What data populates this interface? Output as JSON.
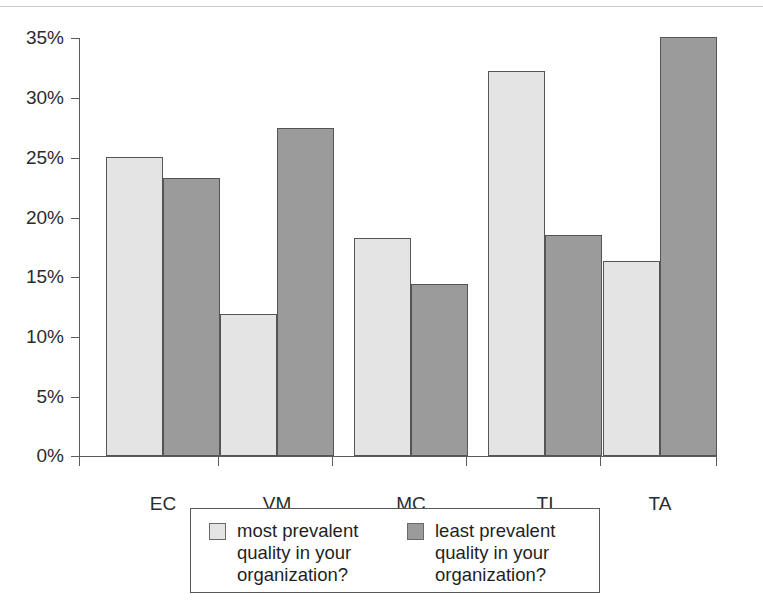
{
  "chart_data": {
    "type": "bar",
    "title": "",
    "subtitle": "",
    "xlabel": "",
    "ylabel": "",
    "categories": [
      "EC",
      "VM",
      "MC",
      "TI",
      "TA"
    ],
    "series": [
      {
        "name": "most prevalent quality in your organization?",
        "color": "#e4e4e4",
        "values": [
          25.0,
          11.9,
          18.2,
          32.2,
          16.3
        ]
      },
      {
        "name": "least prevalent quality in your organization?",
        "color": "#9b9b9b",
        "values": [
          23.2,
          27.4,
          14.4,
          18.5,
          35.0
        ]
      }
    ],
    "ylim": [
      0,
      35
    ],
    "ytick_values": [
      0,
      5,
      10,
      15,
      20,
      25,
      30,
      35
    ],
    "ytick_labels": [
      "0%",
      "5%",
      "10%",
      "15%",
      "20%",
      "25%",
      "30%",
      "35%"
    ],
    "grid": false,
    "legend_position": "bottom",
    "annotations": []
  },
  "axes": {
    "y_labels": [
      "35%",
      "30%",
      "25%",
      "20%",
      "15%",
      "10%",
      "5%",
      "0%"
    ],
    "x_labels": [
      "EC",
      "VM",
      "MC",
      "TI",
      "TA"
    ]
  },
  "legend": {
    "entries": [
      {
        "label": "most prevalent\nquality in your\norganization?",
        "swatch": "light-gray-swatch"
      },
      {
        "label": "least prevalent\nquality in your\norganization?",
        "swatch": "dark-gray-swatch"
      }
    ]
  },
  "colors": {
    "series_light": "#e4e4e4",
    "series_dark": "#9b9b9b",
    "axis": "#5b5b5b",
    "bar_outline": "#555555",
    "text": "#2b2b2b",
    "background": "#ffffff"
  }
}
